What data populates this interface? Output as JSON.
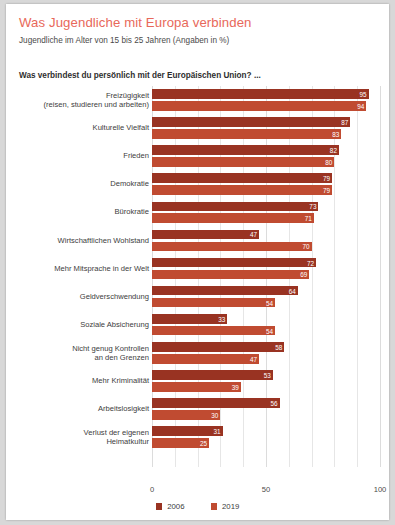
{
  "header": {
    "title": "Was Jugendliche mit Europa verbinden",
    "subtitle": "Jugendliche im Alter von 15 bis 25 Jahren (Angaben in %)",
    "question": "Was verbindest du persönlich mit der Europäischen Union? ...",
    "title_color": "#e8685a"
  },
  "legend": {
    "items": [
      {
        "label": "2006",
        "color": "#993322"
      },
      {
        "label": "2019",
        "color": "#c04b31"
      }
    ]
  },
  "axis": {
    "ticks": [
      "0",
      "50",
      "100"
    ]
  },
  "chart_data": {
    "type": "bar",
    "title": "Was Jugendliche mit Europa verbinden",
    "subtitle": "Jugendliche im Alter von 15 bis 25 Jahren (Angaben in %)",
    "annotation": "Was verbindest du persönlich mit der Europäischen Union? ...",
    "orientation": "horizontal",
    "xlabel": "",
    "ylabel": "",
    "xlim": [
      0,
      100
    ],
    "xticks": [
      0,
      50,
      100
    ],
    "grid": true,
    "legend_position": "bottom",
    "categories": [
      "Freizügigkeit (reisen, studieren und arbeiten)",
      "Kulturelle Vielfalt",
      "Frieden",
      "Demokratie",
      "Bürokratie",
      "Wirtschaftlichen Wohlstand",
      "Mehr Mitsprache in der Welt",
      "Geldverschwendung",
      "Soziale Absicherung",
      "Nicht genug Kontrollen an den Grenzen",
      "Mehr Kriminalität",
      "Arbeitslosigkeit",
      "Verlust der eigenen Heimatkultur"
    ],
    "category_lines": [
      [
        "Freizügigkeit",
        "(reisen, studieren und arbeiten)"
      ],
      [
        "Kulturelle Vielfalt"
      ],
      [
        "Frieden"
      ],
      [
        "Demokratie"
      ],
      [
        "Bürokratie"
      ],
      [
        "Wirtschaftlichen Wohlstand"
      ],
      [
        "Mehr Mitsprache in der Welt"
      ],
      [
        "Geldverschwendung"
      ],
      [
        "Soziale Absicherung"
      ],
      [
        "Nicht genug Kontrollen",
        "an den Grenzen"
      ],
      [
        "Mehr Kriminalität"
      ],
      [
        "Arbeitslosigkeit"
      ],
      [
        "Verlust der eigenen",
        "Heimatkultur"
      ]
    ],
    "series": [
      {
        "name": "2006",
        "color": "#993322",
        "values": [
          95,
          87,
          82,
          79,
          73,
          47,
          72,
          64,
          33,
          58,
          53,
          56,
          31
        ]
      },
      {
        "name": "2019",
        "color": "#c04b31",
        "values": [
          94,
          83,
          80,
          79,
          71,
          70,
          69,
          54,
          54,
          47,
          39,
          30,
          25
        ]
      }
    ]
  }
}
